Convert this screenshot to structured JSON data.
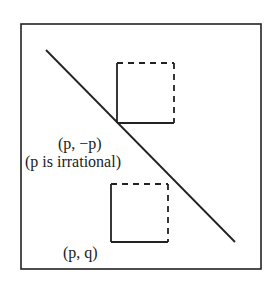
{
  "diagram": {
    "colors": {
      "stroke": "#222222",
      "background": "#ffffff"
    },
    "frame": {
      "x": 20,
      "y": 23,
      "width": 241,
      "height": 246
    },
    "diagonal_line": {
      "x1": 46,
      "y1": 50,
      "x2": 235,
      "y2": 242
    },
    "upper_square": {
      "x": 117,
      "y": 63,
      "size": 58,
      "solid_sides": [
        "left",
        "bottom"
      ],
      "dashed_sides": [
        "top",
        "right"
      ]
    },
    "lower_square": {
      "x": 111,
      "y": 184,
      "size": 58,
      "solid_sides": [
        "left",
        "bottom"
      ],
      "dashed_sides": [
        "top",
        "right"
      ]
    },
    "labels": {
      "point_on_line": "(p, −p)",
      "irrational_note": "(p is irrational)",
      "point_pq": "(p, q)"
    }
  }
}
